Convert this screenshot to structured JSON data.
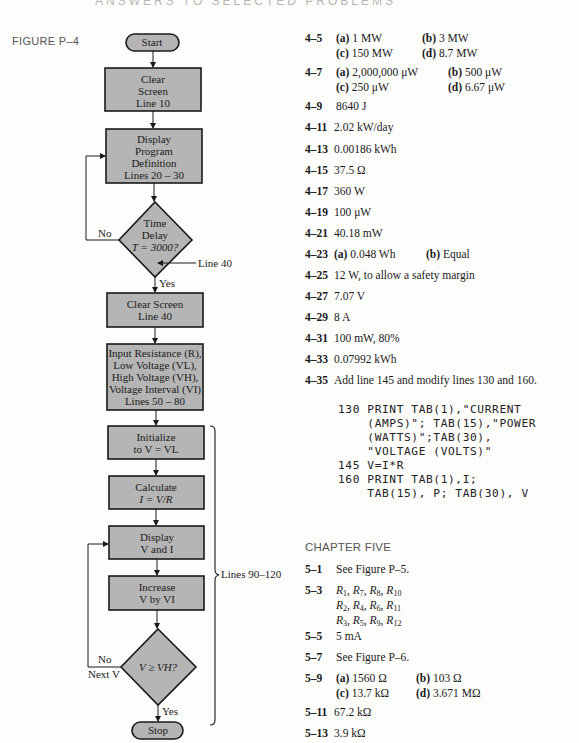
{
  "page_header": "ANSWERS TO SELECTED PROBLEMS",
  "figure": {
    "label": "FIGURE P–4",
    "nodes": {
      "start": "Start",
      "clear_screen": [
        "Clear",
        "Screen",
        "Line 10"
      ],
      "display_program": [
        "Display",
        "Program",
        "Definition",
        "Lines 20 – 30"
      ],
      "time_delay": [
        "Time",
        "Delay",
        "T = 3000?"
      ],
      "clear_screen_40": [
        "Clear Screen",
        "Line 40"
      ],
      "input": [
        "Input Resistance (R),",
        "Low Voltage (VL),",
        "High Voltage (VH),",
        "Voltage Interval (VI)",
        "Lines 50 – 80"
      ],
      "initialize": [
        "Initialize",
        "to V = VL"
      ],
      "calculate": [
        "Calculate",
        "I = V/R"
      ],
      "display_vi": [
        "Display",
        "V and I"
      ],
      "increase": [
        "Increase",
        "V by VI"
      ],
      "compare": "V ≥ VH?",
      "stop": "Stop"
    },
    "labels": {
      "no_1": "No",
      "yes_1": "Yes",
      "line40": "Line 40",
      "no_2": "No",
      "next_v": "Next V",
      "yes_2": "Yes",
      "brace": "Lines 90–120"
    }
  },
  "answers_ch4": [
    {
      "id": "4–5",
      "rows": [
        [
          "(a)",
          "1 MW",
          "(b)",
          "3 MW"
        ],
        [
          "(c)",
          "150 MW",
          "(d)",
          "8.7 MW"
        ]
      ]
    },
    {
      "id": "4–7",
      "rows": [
        [
          "(a)",
          "2,000,000 μW",
          "(b)",
          "500 μW"
        ],
        [
          "(c)",
          "250 μW",
          "(d)",
          "6.67 μW"
        ]
      ]
    },
    {
      "id": "4–9",
      "text": "8640 J"
    },
    {
      "id": "4–11",
      "text": "2.02 kW/day"
    },
    {
      "id": "4–13",
      "text": "0.00186 kWh"
    },
    {
      "id": "4–15",
      "text": "37.5 Ω"
    },
    {
      "id": "4–17",
      "text": "360 W"
    },
    {
      "id": "4–19",
      "text": "100 μW"
    },
    {
      "id": "4–21",
      "text": "40.18 mW"
    },
    {
      "id": "4–23",
      "rows": [
        [
          "(a)",
          "0.048 Wh",
          "(b)",
          "Equal"
        ]
      ]
    },
    {
      "id": "4–25",
      "text": "12 W, to allow a safety margin"
    },
    {
      "id": "4–27",
      "text": "7.07 V"
    },
    {
      "id": "4–29",
      "text": "8 A"
    },
    {
      "id": "4–31",
      "text": "100 mW, 80%"
    },
    {
      "id": "4–33",
      "text": "0.07992 kWh"
    },
    {
      "id": "4–35",
      "text": "Add line 145 and modify lines 130 and 160.",
      "code": [
        "130 PRINT TAB(1),\"CURRENT",
        "    (AMPS)\"; TAB(15),\"POWER",
        "    (WATTS)\";TAB(30),",
        "    \"VOLTAGE (VOLTS)\"",
        "145 V=I*R",
        "160 PRINT TAB(1),I;",
        "    TAB(15), P; TAB(30), V"
      ]
    }
  ],
  "chapter_heading": "CHAPTER FIVE",
  "answers_ch5": [
    {
      "id": "5–1",
      "text": "See Figure P–5."
    },
    {
      "id": "5–3",
      "lines": [
        "R1, R7, R8, R10",
        "R2, R4, R6, R11",
        "R3, R5, R9, R12"
      ]
    },
    {
      "id": "5–5",
      "text": "5 mA"
    },
    {
      "id": "5–7",
      "text": "See Figure P–6."
    },
    {
      "id": "5–9",
      "rows": [
        [
          "(a)",
          "1560 Ω",
          "(b)",
          "103 Ω"
        ],
        [
          "(c)",
          "13.7 kΩ",
          "(d)",
          "3.671 MΩ"
        ]
      ]
    },
    {
      "id": "5–11",
      "text": "67.2 kΩ"
    },
    {
      "id": "5–13",
      "text": "3.9 kΩ"
    },
    {
      "id": "5–15",
      "text": "17.16 kΩ."
    },
    {
      "id": "5–17",
      "rows": [
        [
          "(a)",
          "625 μA",
          "(b)",
          "4.255 μA"
        ]
      ]
    },
    {
      "id": "5–19",
      "text": "0.355 A"
    }
  ]
}
